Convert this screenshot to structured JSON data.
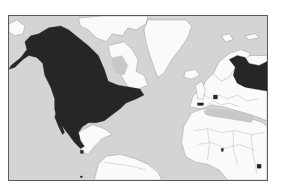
{
  "map": {
    "type": "species-range-map",
    "extent": "North Atlantic: North America, Greenland, Europe, North Africa, northern South America",
    "colors": {
      "ocean": "#d4d4d4",
      "land": "#fafafa",
      "range": "#262626",
      "frame": "#5a5a5a",
      "borders": "#9a9a9a"
    },
    "range_regions": [
      "North America (Alaska, Canada, United States, Mexico)",
      "Northern Europe / western Russia",
      "Isolated patch in central Europe",
      "Isolated patch in Iberia",
      "Small patch in Central America",
      "Small patch in West Africa",
      "Small patch in East Africa"
    ]
  }
}
